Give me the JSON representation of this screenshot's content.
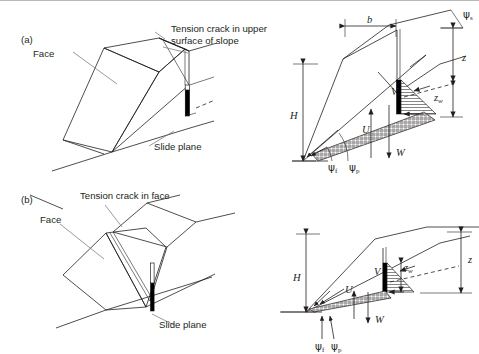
{
  "figure": {
    "background_color": "#ffffff",
    "line_color": "#231f20",
    "leader_color": "#6d6e71",
    "width": 479,
    "height": 354
  },
  "panels": [
    {
      "id": "a",
      "id_label": "(a)",
      "pictorial": {
        "labels": {
          "face": "Face",
          "slide_plane": "Slide plane",
          "tension_crack_line1": "Tension crack in upper",
          "tension_crack_line2": "surface of slope"
        }
      },
      "section": {
        "symbols": {
          "slope_height": "H",
          "crack_offset": "b",
          "crack_depth": "z",
          "water_depth_base": "z",
          "water_depth_sub": "w",
          "water_force_crack": "V",
          "water_force_plane": "U",
          "weight": "W",
          "slope_face_angle_base": "ψ",
          "slope_face_angle_sub": "f",
          "plane_angle_base": "ψ",
          "plane_angle_sub": "p",
          "upper_surface_angle_base": "ψ",
          "upper_surface_angle_sub": "s"
        }
      }
    },
    {
      "id": "b",
      "id_label": "(b)",
      "pictorial": {
        "labels": {
          "face": "Face",
          "slide_plane": "Slide plane",
          "tension_crack_line1": "Tension crack in face",
          "tension_crack_line2": ""
        }
      },
      "section": {
        "symbols": {
          "slope_height": "H",
          "crack_depth": "z",
          "water_depth_base": "z",
          "water_depth_sub": "w",
          "water_force_crack": "V",
          "water_force_plane": "U",
          "weight": "W",
          "slope_face_angle_base": "ψ",
          "slope_face_angle_sub": "f",
          "plane_angle_base": "ψ",
          "plane_angle_sub": "p"
        }
      }
    }
  ]
}
